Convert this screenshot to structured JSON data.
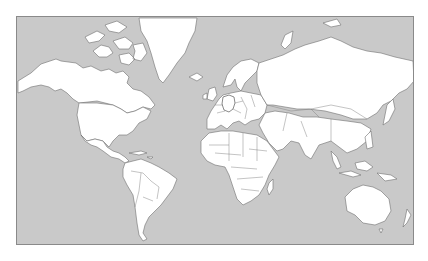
{
  "map": {
    "title": "World map",
    "projection": "Mercator",
    "highlighted_country": "Germany",
    "colors": {
      "ocean": "#c9c9c9",
      "land": "#ffffff",
      "borders": "#6e6e6e",
      "highlight": "#555555",
      "frame": "#8a8a8a"
    }
  }
}
